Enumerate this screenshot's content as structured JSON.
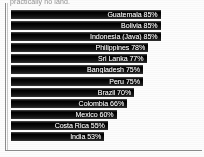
{
  "figure": {
    "caption_fragment": "practically no land.",
    "bar_color": "#0d0d0d",
    "label_color": "#f2f2f2",
    "background_color": "#fdfdfd",
    "frame_color": "#8d8d8d"
  },
  "chart_data": {
    "type": "bar",
    "orientation": "horizontal",
    "title": "",
    "subtitle": "",
    "xlabel": "",
    "ylabel": "",
    "xlim": [
      0,
      100
    ],
    "grid": false,
    "legend": false,
    "value_suffix": "%",
    "labels_inside_bars": true,
    "categories": [
      "Guatemala",
      "Bolivia",
      "Indonesia (Java)",
      "Philippines",
      "Sri Lanka",
      "Bangladesh",
      "Peru",
      "Brazil",
      "Colombia",
      "Mexico",
      "Costa Rica",
      "India"
    ],
    "values": [
      85,
      85,
      85,
      78,
      77,
      75,
      75,
      70,
      66,
      60,
      55,
      53
    ],
    "bars": [
      {
        "category": "Guatemala",
        "value": 85,
        "label": "Guatemala 85%"
      },
      {
        "category": "Bolivia",
        "value": 85,
        "label": "Bolivia 85%"
      },
      {
        "category": "Indonesia (Java)",
        "value": 85,
        "label": "Indonesia (Java) 85%"
      },
      {
        "category": "Philippines",
        "value": 78,
        "label": "Philippines 78%"
      },
      {
        "category": "Sri Lanka",
        "value": 77,
        "label": "Sri Lanka 77%"
      },
      {
        "category": "Bangladesh",
        "value": 75,
        "label": "Bangladesh 75%"
      },
      {
        "category": "Peru",
        "value": 75,
        "label": "Peru 75%"
      },
      {
        "category": "Brazil",
        "value": 70,
        "label": "Brazil 70%"
      },
      {
        "category": "Colombia",
        "value": 66,
        "label": "Colombia 66%"
      },
      {
        "category": "Mexico",
        "value": 60,
        "label": "Mexico 60%"
      },
      {
        "category": "Costa Rica",
        "value": 55,
        "label": "Costa Rica 55%"
      },
      {
        "category": "India",
        "value": 53,
        "label": "India 53%"
      }
    ]
  }
}
